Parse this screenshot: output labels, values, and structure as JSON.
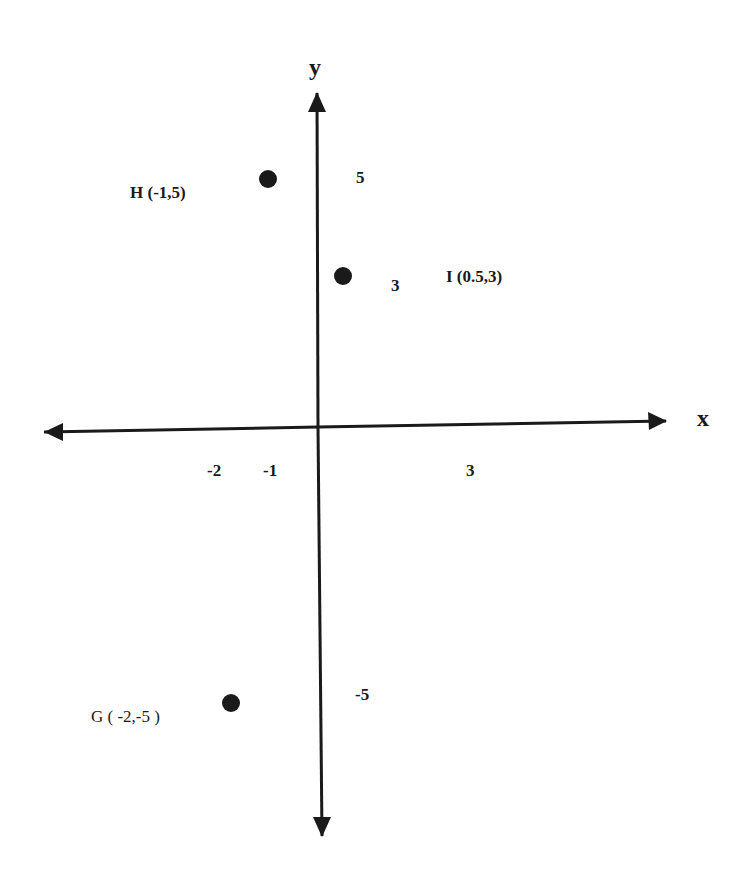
{
  "diagram": {
    "type": "coordinate-plane",
    "axes": {
      "x_label": "x",
      "y_label": "y",
      "x_ticks": [
        "-2",
        "-1",
        "3"
      ],
      "y_ticks": [
        "5",
        "3",
        "-5"
      ]
    },
    "points": [
      {
        "name": "H",
        "label": "H (-1,5)",
        "x": -1,
        "y": 5
      },
      {
        "name": "I",
        "label": "I (0.5,3)",
        "x": 0.5,
        "y": 3
      },
      {
        "name": "G",
        "label": "G ( -2,-5 )",
        "x": -2,
        "y": -5
      }
    ],
    "colors": {
      "ink": "#1a1a1a",
      "background": "#ffffff"
    }
  }
}
